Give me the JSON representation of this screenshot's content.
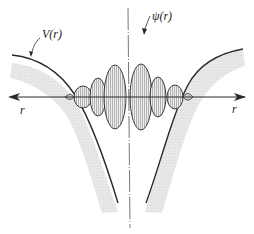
{
  "diagram": {
    "title": "",
    "labels": {
      "potential": "V(r)",
      "wavefunction": "ψ(r)",
      "axis_left": "r",
      "axis_right": "r"
    },
    "colors": {
      "stroke": "#2a2a2a",
      "shading": "#d8d8d8",
      "lobe_fill": "#e2e2e2",
      "center_line": "#666666"
    },
    "lobes": [
      {
        "cx": 83,
        "rx": 9,
        "ry": 11
      },
      {
        "cx": 98,
        "rx": 8,
        "ry": 19
      },
      {
        "cx": 115,
        "rx": 11,
        "ry": 32
      },
      {
        "cx": 141,
        "rx": 11,
        "ry": 33
      },
      {
        "cx": 158,
        "rx": 8,
        "ry": 20
      },
      {
        "cx": 175,
        "rx": 8,
        "ry": 12
      }
    ]
  }
}
